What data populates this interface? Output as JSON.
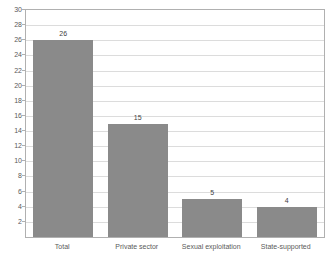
{
  "chart_data": {
    "type": "bar",
    "title": "",
    "title_note": "title row is cropped off the top edge of the screenshot and is illegible",
    "xlabel": "",
    "ylabel": "",
    "categories": [
      "Total",
      "Private sector",
      "Sexual exploitation",
      "State-supported"
    ],
    "values": [
      26,
      15,
      5,
      4
    ],
    "data_labels": [
      "26",
      "15",
      "5",
      "4"
    ],
    "ylim": [
      0,
      30
    ],
    "ytick_step": 2,
    "yticks": [
      0,
      2,
      4,
      6,
      8,
      10,
      12,
      14,
      16,
      18,
      20,
      22,
      24,
      26,
      28,
      30
    ],
    "ytick_labels": [
      "",
      "2",
      "4",
      "6",
      "8",
      "10",
      "12",
      "14",
      "16",
      "18",
      "20",
      "22",
      "24",
      "26",
      "28",
      "30"
    ],
    "grid": true,
    "grid_axis": "y",
    "legend": false,
    "legend_position": "none",
    "series": [
      {
        "name": "",
        "values": [
          26,
          15,
          5,
          4
        ]
      }
    ]
  },
  "colors": {
    "bar_fill": "#8a8a8a",
    "gridline": "#dcdcdc",
    "plot_border": "#b0b0b0",
    "axis_text": "#5a5a5a",
    "data_label_text": "#3f3f3f",
    "background": "#ffffff"
  }
}
